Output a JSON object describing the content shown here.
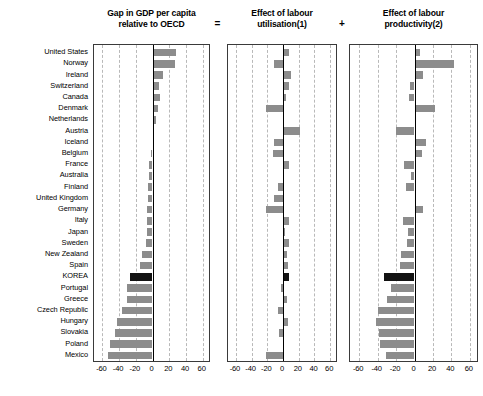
{
  "chart_data": {
    "type": "bar",
    "orientation": "horizontal",
    "title": "",
    "layout": {
      "panels": 3,
      "grid": true,
      "gridlines_at": [
        -60,
        -40,
        -20,
        20,
        40,
        60
      ],
      "zero_axis": true,
      "legend": "none",
      "shared_categories": true,
      "highlight_category": "KOREA",
      "highlight_color": "#121212",
      "bar_color": "#8c8c8c"
    },
    "xlim": [
      -70,
      70
    ],
    "xticks": [
      -60,
      -40,
      -20,
      0,
      20,
      40,
      60
    ],
    "xtick_labels": [
      "-60",
      "-40",
      "-20",
      "0",
      "20",
      "40",
      "60"
    ],
    "xlabel": "",
    "ylabel": "",
    "categories": [
      "United States",
      "Norway",
      "Ireland",
      "Switzerland",
      "Canada",
      "Denmark",
      "Netherlands",
      "Austria",
      "Iceland",
      "Belgium",
      "France",
      "Australia",
      "Finland",
      "United Kingdom",
      "Germany",
      "Italy",
      "Japan",
      "Sweden",
      "New Zealand",
      "Spain",
      "KOREA",
      "Portugal",
      "Greece",
      "Czech Republic",
      "Hungary",
      "Slovakia",
      "Poland",
      "Mexico"
    ],
    "panels": [
      {
        "id": "gap-in-gdp",
        "title": "Gap in GDP per capita relative to OECD",
        "title_lines": [
          "Gap in GDP per capita",
          "relative to OECD"
        ],
        "values": [
          28,
          27,
          13,
          8,
          9,
          6,
          4,
          2,
          2,
          -2,
          -4,
          -4,
          -5,
          -5,
          -6,
          -7,
          -7,
          -8,
          -13,
          -15,
          -27,
          -30,
          -31,
          -37,
          -43,
          -45,
          -51,
          -53
        ]
      },
      {
        "id": "effect-of-labour-utilisation",
        "title": "Effect of labour utilisation(1)",
        "title_lines": [
          "Effect of labour",
          "utilisation(1)"
        ],
        "values": [
          8,
          -12,
          10,
          8,
          4,
          -22,
          0,
          22,
          -12,
          -13,
          7,
          1,
          -6,
          -11,
          -22,
          8,
          3,
          7,
          5,
          6,
          7,
          -3,
          5,
          -6,
          6,
          -5,
          0,
          -22
        ]
      },
      {
        "id": "effect-of-labour-productivity",
        "title": "Effect of labour productivity(2)",
        "title_lines": [
          "Effect of labour",
          "productivity(2)"
        ],
        "values": [
          6,
          43,
          9,
          -5,
          -6,
          22,
          2,
          -20,
          12,
          8,
          -11,
          -4,
          -9,
          2,
          9,
          -12,
          -7,
          -8,
          -15,
          -16,
          -33,
          -25,
          -30,
          -40,
          -42,
          -38,
          -37,
          -31
        ]
      }
    ],
    "operators": [
      {
        "symbol": "=",
        "after_panel": 0
      },
      {
        "symbol": "+",
        "after_panel": 1
      }
    ]
  }
}
